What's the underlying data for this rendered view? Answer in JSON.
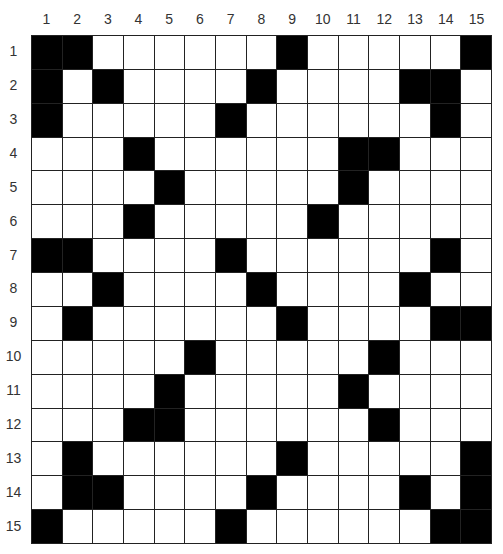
{
  "puzzle": {
    "type": "crossword-grid",
    "rows": 15,
    "cols": 15,
    "column_labels": [
      "1",
      "2",
      "3",
      "4",
      "5",
      "6",
      "7",
      "8",
      "9",
      "10",
      "11",
      "12",
      "13",
      "14",
      "15"
    ],
    "row_labels": [
      "1",
      "2",
      "3",
      "4",
      "5",
      "6",
      "7",
      "8",
      "9",
      "10",
      "11",
      "12",
      "13",
      "14",
      "15"
    ],
    "colors": {
      "black_cell": "#000000",
      "white_cell": "#ffffff",
      "grid_line": "#222222",
      "label_text": "#333333"
    },
    "black_cells_by_row": {
      "1": [
        1,
        2,
        9,
        15
      ],
      "2": [
        1,
        3,
        8,
        13,
        14
      ],
      "3": [
        1,
        7,
        14
      ],
      "4": [
        4,
        11,
        12
      ],
      "5": [
        5,
        11
      ],
      "6": [
        4,
        10
      ],
      "7": [
        1,
        2,
        7,
        14
      ],
      "8": [
        3,
        8,
        13
      ],
      "9": [
        2,
        9,
        14,
        15
      ],
      "10": [
        6,
        12
      ],
      "11": [
        5,
        11
      ],
      "12": [
        4,
        5,
        12
      ],
      "13": [
        2,
        9,
        15
      ],
      "14": [
        2,
        3,
        8,
        13,
        15
      ],
      "15": [
        1,
        7,
        14,
        15
      ]
    }
  }
}
